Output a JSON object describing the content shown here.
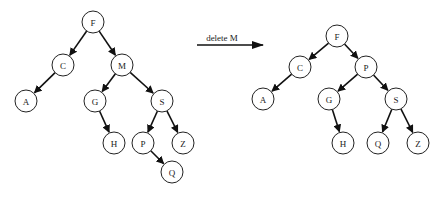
{
  "diagram": {
    "type": "binary-search-tree-deletion",
    "node_radius": 11,
    "colors": {
      "stroke": "#222222",
      "fill": "#ffffff",
      "edge": "#111111"
    },
    "operation": {
      "label": "delete M",
      "arrow": {
        "x1": 197,
        "y1": 45,
        "x2": 263,
        "y2": 45
      },
      "label_pos": {
        "x": 222,
        "y": 41
      }
    },
    "before": {
      "name": "tree-before",
      "nodes": [
        {
          "id": "F",
          "label": "F",
          "x": 93,
          "y": 22
        },
        {
          "id": "C",
          "label": "C",
          "x": 63,
          "y": 65
        },
        {
          "id": "M",
          "label": "M",
          "x": 122,
          "y": 65
        },
        {
          "id": "A",
          "label": "A",
          "x": 26,
          "y": 101
        },
        {
          "id": "G",
          "label": "G",
          "x": 95,
          "y": 101
        },
        {
          "id": "S",
          "label": "S",
          "x": 162,
          "y": 101
        },
        {
          "id": "H",
          "label": "H",
          "x": 114,
          "y": 143
        },
        {
          "id": "P",
          "label": "P",
          "x": 143,
          "y": 143
        },
        {
          "id": "Z",
          "label": "Z",
          "x": 183,
          "y": 143
        },
        {
          "id": "Q",
          "label": "Q",
          "x": 172,
          "y": 172
        }
      ],
      "edges": [
        [
          "F",
          "C"
        ],
        [
          "F",
          "M"
        ],
        [
          "C",
          "A"
        ],
        [
          "M",
          "G"
        ],
        [
          "M",
          "S"
        ],
        [
          "G",
          "H"
        ],
        [
          "S",
          "P"
        ],
        [
          "S",
          "Z"
        ],
        [
          "P",
          "Q"
        ]
      ]
    },
    "after": {
      "name": "tree-after",
      "nodes": [
        {
          "id": "F",
          "label": "F",
          "x": 337,
          "y": 36
        },
        {
          "id": "C",
          "label": "C",
          "x": 300,
          "y": 67
        },
        {
          "id": "P",
          "label": "P",
          "x": 366,
          "y": 67
        },
        {
          "id": "A",
          "label": "A",
          "x": 263,
          "y": 99
        },
        {
          "id": "G",
          "label": "G",
          "x": 329,
          "y": 99
        },
        {
          "id": "S",
          "label": "S",
          "x": 396,
          "y": 99
        },
        {
          "id": "H",
          "label": "H",
          "x": 343,
          "y": 143
        },
        {
          "id": "Q",
          "label": "Q",
          "x": 378,
          "y": 143
        },
        {
          "id": "Z",
          "label": "Z",
          "x": 418,
          "y": 143
        }
      ],
      "edges": [
        [
          "F",
          "C"
        ],
        [
          "F",
          "P"
        ],
        [
          "C",
          "A"
        ],
        [
          "P",
          "G"
        ],
        [
          "P",
          "S"
        ],
        [
          "G",
          "H"
        ],
        [
          "S",
          "Q"
        ],
        [
          "S",
          "Z"
        ]
      ]
    }
  }
}
